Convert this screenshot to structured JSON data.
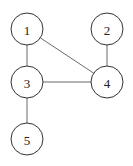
{
  "graph": {
    "node_radius": 16,
    "colors": {
      "edge": "#6b6b6b",
      "node_stroke": "#333333",
      "node_fill": "#ffffff",
      "label": "#222222"
    },
    "nodes": [
      {
        "id": "1",
        "label": "1",
        "x": 27,
        "y": 29
      },
      {
        "id": "2",
        "label": "2",
        "x": 107,
        "y": 29
      },
      {
        "id": "3",
        "label": "3",
        "x": 27,
        "y": 82
      },
      {
        "id": "4",
        "label": "4",
        "x": 107,
        "y": 82
      },
      {
        "id": "5",
        "label": "5",
        "x": 27,
        "y": 139
      }
    ],
    "edges": [
      {
        "from": "1",
        "to": "3"
      },
      {
        "from": "1",
        "to": "4"
      },
      {
        "from": "2",
        "to": "4"
      },
      {
        "from": "3",
        "to": "4"
      },
      {
        "from": "3",
        "to": "5"
      }
    ]
  }
}
